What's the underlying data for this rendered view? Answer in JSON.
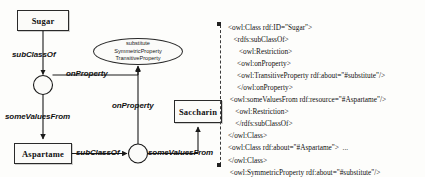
{
  "diagram": {
    "nodes": [
      {
        "id": "sugar",
        "label": "Sugar",
        "shape": "rectangle"
      },
      {
        "id": "aspartame",
        "label": "Aspartame",
        "shape": "rectangle"
      },
      {
        "id": "saccharin",
        "label": "Saccharin",
        "shape": "rectangle"
      },
      {
        "id": "restriction-1",
        "label": "",
        "shape": "circle"
      },
      {
        "id": "restriction-2",
        "label": "",
        "shape": "circle"
      }
    ],
    "property_node": {
      "line1": "substitute",
      "line2": "SymmetricProperty",
      "line3": "TransitiveProperty"
    },
    "edges": {
      "subclassof_sugar": "subClassOf",
      "onproperty_top": "onProperty",
      "somevaluesfrom_left": "someValuesFrom",
      "onproperty_bottom": "onProperty",
      "subclassof_aspartame": "subClassOf",
      "somevaluesfrom_bottom": "someValuesFrom"
    }
  },
  "xml": {
    "lines": [
      "<owl:Class rdf:ID=\"Sugar\">",
      "   <rdfs:subClassOf>",
      "      <owl:Restriction>",
      "     <owl:onProperty>",
      "     <owl:TransitiveProperty rdf:about=\"#substitute\"/>",
      "     </owl:onProperty>",
      " <owl:someValuesFrom rdf:resource=\"#Aspartame\"/>",
      "    <owl:Restriction>",
      "    </rdfs:subClassOf>",
      "</owl:Class>",
      "<owl:Class rdf:about=\"#Aspartame\">  ...",
      "</owl:Class>",
      " <owl:SymmetricProperty rdf:about=\"#substitute\"/>"
    ]
  }
}
